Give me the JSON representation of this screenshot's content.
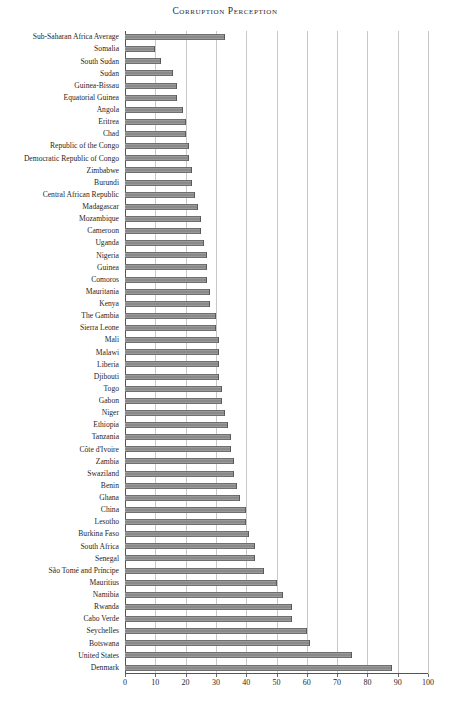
{
  "chart_data": {
    "type": "bar",
    "orientation": "horizontal",
    "title": "Corruption Perception",
    "xlabel": "",
    "ylabel": "",
    "xlim": [
      0,
      100
    ],
    "xticks": [
      0,
      10,
      20,
      30,
      40,
      50,
      60,
      70,
      80,
      90,
      100
    ],
    "grid": true,
    "legend": false,
    "bar_color": "#8a8a8a",
    "bar_edge_color": "#5a5a5a",
    "gridline_color": "#c9c9c9",
    "axis_color": "#555555",
    "categories": [
      "Sub-Saharan Africa Average",
      "Somalia",
      "South Sudan",
      "Sudan",
      "Guinea-Bissau",
      "Equatorial Guinea",
      "Angola",
      "Eritrea",
      "Chad",
      "Republic of the Congo",
      "Democratic Republic of Congo",
      "Zimbabwe",
      "Burundi",
      "Central African Republic",
      "Madagascar",
      "Mozambique",
      "Cameroon",
      "Uganda",
      "Nigeria",
      "Guinea",
      "Comoros",
      "Mauritania",
      "Kenya",
      "The Gambia",
      "Sierra Leone",
      "Mali",
      "Malawi",
      "Liberia",
      "Djibouti",
      "Togo",
      "Gabon",
      "Niger",
      "Ethiopia",
      "Tanzania",
      "Côte d'Ivoire",
      "Zambia",
      "Swaziland",
      "Benin",
      "Ghana",
      "China",
      "Lesotho",
      "Burkina Faso",
      "South Africa",
      "Senegal",
      "São Tomé and Príncipe",
      "Mauritius",
      "Namibia",
      "Rwanda",
      "Cabo Verde",
      "Seychelles",
      "Botswana",
      "United States",
      "Denmark"
    ],
    "values": [
      33,
      10,
      12,
      16,
      17,
      17,
      19,
      20,
      20,
      21,
      21,
      22,
      22,
      23,
      24,
      25,
      25,
      26,
      27,
      27,
      27,
      28,
      28,
      30,
      30,
      31,
      31,
      31,
      31,
      32,
      32,
      33,
      34,
      35,
      35,
      36,
      36,
      37,
      38,
      40,
      40,
      41,
      43,
      43,
      46,
      50,
      52,
      55,
      55,
      60,
      61,
      75,
      88
    ],
    "tick_labels": [
      "0",
      "10",
      "20",
      "30",
      "40",
      "50",
      "60",
      "70",
      "80",
      "90",
      "100"
    ]
  }
}
